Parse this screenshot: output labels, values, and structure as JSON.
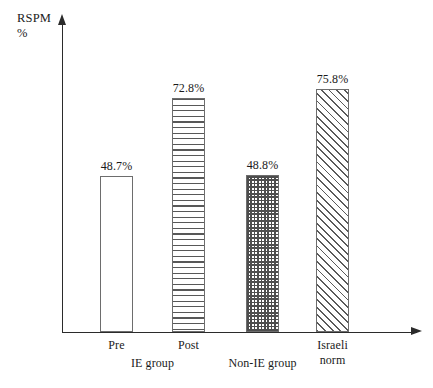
{
  "chart_data": {
    "type": "bar",
    "title": "",
    "subtitle": "",
    "xlabel": "",
    "ylabel": "RSPM %",
    "ylabel_lines": [
      "RSPM",
      "%"
    ],
    "categories": [
      "Pre",
      "Post",
      "Non-IE group",
      "Israeli norm"
    ],
    "values": [
      48.7,
      48.7999,
      72.8,
      75.8
    ],
    "series": [
      {
        "name": "RSPM %",
        "values": [
          48.7,
          72.8,
          48.8,
          75.8
        ]
      }
    ],
    "data_labels": [
      "48.7%",
      "72.8%",
      "48.8%",
      "75.8%"
    ],
    "ylim": [
      0,
      96
    ],
    "grid": false,
    "legend": false,
    "legend_position": "none",
    "axis_arrows": true,
    "bar_fills": [
      "solid-white",
      "horizontal-lines",
      "crosshatch",
      "diagonal-lines"
    ],
    "group_labels": [
      "IE group",
      "Non-IE group",
      "Israeli norm"
    ]
  },
  "axes": {
    "y_title_line1": "RSPM",
    "y_title_line2": "%"
  },
  "bars": [
    {
      "id": "bar-pre",
      "tick": "Pre",
      "label": "48.7%",
      "value": 48.7,
      "fill": "plain"
    },
    {
      "id": "bar-post",
      "tick": "Post",
      "label": "72.8%",
      "value": 72.8,
      "fill": "hlines"
    },
    {
      "id": "bar-non-ie",
      "tick": "",
      "label": "48.8%",
      "value": 48.8,
      "fill": "cross"
    },
    {
      "id": "bar-israeli-norm",
      "tick": "",
      "label": "75.8%",
      "value": 75.8,
      "fill": "diag"
    }
  ],
  "ticks": {
    "pre": "Pre",
    "post": "Post"
  },
  "groups": {
    "ie_group": "IE group",
    "non_ie_group": "Non-IE group",
    "israeli_norm_line1": "Israeli",
    "israeli_norm_line2": "norm"
  }
}
